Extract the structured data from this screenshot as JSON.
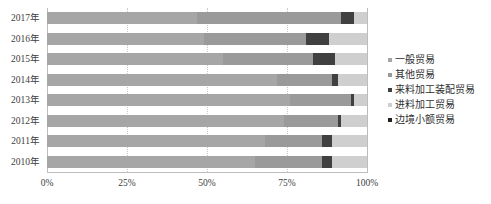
{
  "chart_data": {
    "type": "bar",
    "orientation": "horizontal",
    "stacked": true,
    "normalized": true,
    "title": "",
    "xlabel": "",
    "ylabel": "",
    "xlim": [
      0,
      100
    ],
    "xtick_labels": [
      "0%",
      "25%",
      "50%",
      "75%",
      "100%"
    ],
    "xtick_values": [
      0,
      25,
      50,
      75,
      100
    ],
    "grid": true,
    "grid_axis": "x",
    "legend_position": "right",
    "categories": [
      "2017年",
      "2016年",
      "2015年",
      "2014年",
      "2013年",
      "2012年",
      "2011年",
      "2010年"
    ],
    "series": [
      {
        "name": "一般贸易",
        "color": "#a6a6a6",
        "values": [
          47.0,
          49.0,
          55.0,
          72.0,
          76.0,
          74.0,
          68.0,
          65.0
        ]
      },
      {
        "name": "其他贸易",
        "color": "#9a9a9a",
        "values": [
          45.0,
          32.0,
          28.0,
          17.0,
          19.0,
          17.0,
          18.0,
          21.0
        ]
      },
      {
        "name": "来料加工装配贸易",
        "color": "#404040",
        "values": [
          4.0,
          7.0,
          7.0,
          2.0,
          0.8,
          0.8,
          3.0,
          3.0
        ]
      },
      {
        "name": "进料加工贸易",
        "color": "#cfcfcf",
        "values": [
          4.0,
          12.0,
          10.0,
          9.0,
          4.2,
          8.2,
          11.0,
          11.0
        ]
      },
      {
        "name": "边境小额贸易",
        "color": "#1f1f1f",
        "values": [
          0.0,
          0.0,
          0.0,
          0.0,
          0.0,
          0.0,
          0.0,
          0.0
        ]
      }
    ]
  },
  "legend": {
    "items": [
      {
        "label": "一般贸易",
        "color": "#a6a6a6"
      },
      {
        "label": "其他贸易",
        "color": "#9a9a9a"
      },
      {
        "label": "来料加工装配贸易",
        "color": "#404040"
      },
      {
        "label": "进料加工贸易",
        "color": "#cfcfcf"
      },
      {
        "label": "边境小额贸易",
        "color": "#1f1f1f"
      }
    ]
  }
}
